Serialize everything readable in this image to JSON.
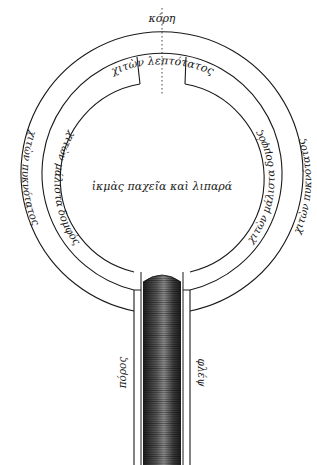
{
  "diagram": {
    "title_top": "κόρη",
    "layers": {
      "outer_top": "χιτὼν λεπτότατος",
      "outer_left": "χιτὼν πυκνότατος",
      "outer_right": "χιτὼν πυκνότατος",
      "middle_left": "χιτὼν μάλιστα δομφός",
      "middle_right": "χιτὼν μάλιστα δομφός",
      "center": "ἰκμὰς παχεῖα καὶ λιπαρά"
    },
    "tube": {
      "left_label": "πόρος",
      "right_label": "φλέψ"
    },
    "colors": {
      "ink": "#1a1a1a",
      "paper": "#ffffff",
      "tube_dark": "#2a2a2a",
      "tube_light": "#9a9a9a"
    }
  }
}
